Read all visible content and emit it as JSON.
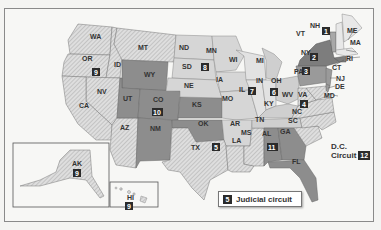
{
  "colors": {
    "dark": "#8d8d8d",
    "medium": "#b9b9b9",
    "light": "#d9d9d9",
    "hatched_base": "#dcdcdc",
    "badge": "#2b2b2b",
    "background": "#f7f7f5"
  },
  "legend": {
    "badge": "5",
    "label": "Judicial circuit"
  },
  "dc": {
    "label_line1": "D.C.",
    "label_line2": "Circuit",
    "badge": "12"
  },
  "states": {
    "WA": "WA",
    "OR": "OR",
    "ID": "ID",
    "MT": "MT",
    "NV": "NV",
    "CA": "CA",
    "AZ": "AZ",
    "UT": "UT",
    "WY": "WY",
    "CO": "CO",
    "NM": "NM",
    "ND": "ND",
    "SD": "SD",
    "NE": "NE",
    "KS": "KS",
    "OK": "OK",
    "TX": "TX",
    "MN": "MN",
    "IA": "IA",
    "MO": "MO",
    "AR": "AR",
    "LA": "LA",
    "MS": "MS",
    "WI": "WI",
    "IL": "IL",
    "IN": "IN",
    "MI": "MI",
    "OH": "OH",
    "KY": "KY",
    "TN": "TN",
    "AL": "AL",
    "GA": "GA",
    "FL": "FL",
    "SC": "SC",
    "NC": "NC",
    "VA": "VA",
    "WV": "WV",
    "MD": "MD",
    "DE": "DE",
    "NJ": "NJ",
    "PA": "PA",
    "NY": "NY",
    "CT": "CT",
    "RI": "RI",
    "MA": "MA",
    "VT": "VT",
    "NH": "NH",
    "ME": "ME",
    "AK": "AK",
    "HI": "HI"
  },
  "circuits": {
    "c1": "1",
    "c2": "2",
    "c3": "3",
    "c4": "4",
    "c5": "5",
    "c6": "6",
    "c7": "7",
    "c8": "8",
    "c9_main": "9",
    "c9_ak": "9",
    "c9_hi": "9",
    "c10": "10",
    "c11": "11"
  }
}
